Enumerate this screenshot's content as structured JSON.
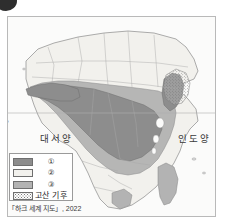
{
  "figure": {
    "bullet_marker": "numbered-bullet",
    "map_title_region": "Africa"
  },
  "map": {
    "equator_label": "0°",
    "oceans": [
      {
        "name": "atlantic",
        "label": "대서양"
      },
      {
        "name": "indian",
        "label": "인도양"
      }
    ],
    "regions": {
      "desert_label": "②",
      "rainforest_label": "①",
      "savanna_label": "③"
    }
  },
  "legend": {
    "items": [
      {
        "key": "climate-1",
        "label": "①",
        "color": "#8d8d8d",
        "pattern": "solid"
      },
      {
        "key": "climate-2",
        "label": "②",
        "color": "#f2f1ed",
        "pattern": "solid"
      },
      {
        "key": "climate-3",
        "label": "③",
        "color": "#b3b3b3",
        "pattern": "solid"
      },
      {
        "key": "highland-climate",
        "label": "고산 기후",
        "color": "#ffffff",
        "pattern": "stipple"
      }
    ]
  },
  "source": {
    "citation": "「하크 세계 지도」, 2022"
  },
  "colors": {
    "rainforest": "#8d8d8d",
    "savanna": "#b3b3b3",
    "desert": "#f2f1ed",
    "sea": "#fbfbfa",
    "border": "#9a9a9a",
    "coastline": "#8a8a8a"
  }
}
